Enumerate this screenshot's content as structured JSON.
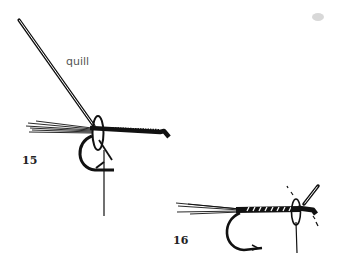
{
  "diagram": {
    "labels": {
      "quill": "quill",
      "figure_15": "15",
      "figure_16": "16"
    },
    "figures": [
      {
        "number": "15",
        "description": "Hook with tail fibers and thread-wrapped body; quill tied in at the head with a thread loop"
      },
      {
        "number": "16",
        "description": "Hook with quill ribbed body, quill trimmed at the head with loop of thread"
      }
    ],
    "colors": {
      "ink": "#111111",
      "background": "#ffffff",
      "label": "#555555"
    }
  }
}
